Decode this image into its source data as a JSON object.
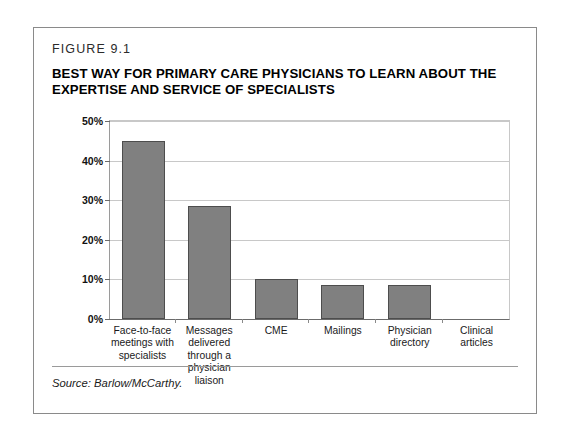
{
  "figure": {
    "label": "FIGURE 9.1",
    "title": "BEST WAY FOR PRIMARY CARE PHYSICIANS TO LEARN ABOUT THE EXPERTISE AND SERVICE OF SPECIALISTS",
    "source": "Source: Barlow/McCarthy.",
    "border_color": "#8a8a8a"
  },
  "chart_data": {
    "type": "bar",
    "title": "BEST WAY FOR PRIMARY CARE PHYSICIANS TO LEARN ABOUT THE EXPERTISE AND SERVICE OF SPECIALISTS",
    "categories": [
      "Face-to-face meetings with specialists",
      "Messages delivered through a physician liaison",
      "CME",
      "Mailings",
      "Physician directory",
      "Clinical articles"
    ],
    "values": [
      45,
      28.5,
      10,
      8.5,
      8.5,
      0
    ],
    "xlabel": "",
    "ylabel": "",
    "ylim": [
      0,
      50
    ],
    "ytick_values": [
      0,
      10,
      20,
      30,
      40,
      50
    ],
    "ytick_labels": [
      "0%",
      "10%",
      "20%",
      "30%",
      "40%",
      "50%"
    ],
    "grid": true,
    "legend": false,
    "bar_color": "#808080",
    "bar_border_color": "#4d4d4d"
  }
}
